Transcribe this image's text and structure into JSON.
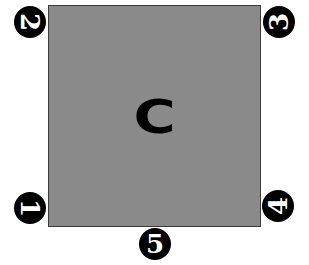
{
  "diagram": {
    "center_label": "C",
    "square_color": "#8a8a8a",
    "markers": [
      {
        "number": "1",
        "position": "bottom-left",
        "rotation_deg": 90
      },
      {
        "number": "2",
        "position": "top-left",
        "rotation_deg": 90
      },
      {
        "number": "3",
        "position": "top-right",
        "rotation_deg": -90
      },
      {
        "number": "4",
        "position": "bottom-right",
        "rotation_deg": -90
      },
      {
        "number": "5",
        "position": "bottom-center",
        "rotation_deg": 0
      }
    ]
  }
}
